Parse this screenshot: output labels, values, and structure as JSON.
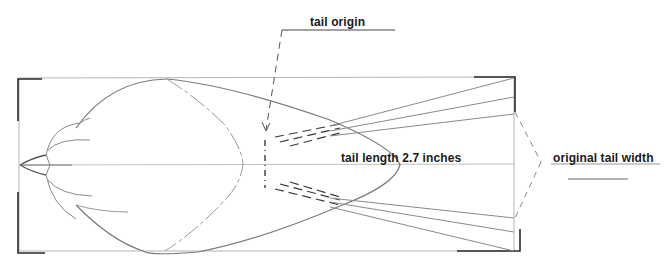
{
  "diagram": {
    "labels": {
      "tail_origin": "tail origin",
      "tail_length": "tail length 2.7 inches",
      "original_tail_width": "original tail width"
    },
    "measurements": {
      "tail_length_value": "2.7",
      "tail_length_unit": "inches"
    },
    "colors": {
      "stroke_light": "#a8a8a8",
      "stroke_mid": "#7a7a7a",
      "stroke_dark": "#2a2a2a",
      "text": "#1a1a1a",
      "background": "#ffffff"
    }
  }
}
